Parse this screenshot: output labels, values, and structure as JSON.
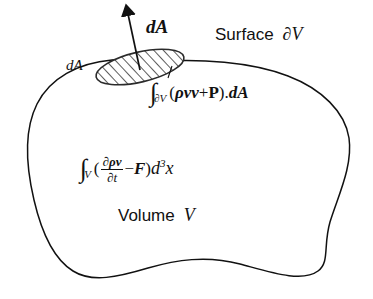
{
  "figure": {
    "background_color": "#ffffff",
    "stroke_color": "#111111"
  },
  "labels": {
    "surface_word": "Surface",
    "surface_symbol": "∂V",
    "volume_word": "Volume",
    "volume_symbol": "V",
    "area_vector": "dA",
    "area_scalar": "dA"
  },
  "surface_integral": {
    "integral_sign": "∫",
    "subscript": "∂V",
    "open_paren": "(",
    "rho": "ρ",
    "vv": "vv",
    "plus": "+",
    "pressure_tensor": "P",
    "close_paren": ")",
    "dot": ".",
    "area_vector": "dA",
    "full_text": "∫_∂V(ρvv+P).dA"
  },
  "volume_integral": {
    "integral_sign": "∫",
    "subscript": "V",
    "open_paren": "(",
    "numerator": "∂ρv",
    "denominator": "∂t",
    "minus": "−",
    "force": "F",
    "close_paren": ")",
    "differential": "d",
    "exponent": "3",
    "variable": "x",
    "full_text": "∫_V(∂ρv/∂t − F)d³x"
  },
  "shapes": {
    "volume_blob": "closed irregular blob outline",
    "surface_patch": "hatched tilted ellipse on boundary",
    "normal_arrow": "outward normal vector arrow"
  }
}
